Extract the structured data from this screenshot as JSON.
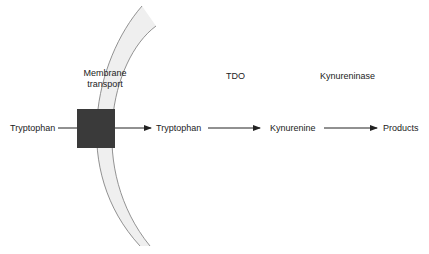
{
  "diagram": {
    "type": "metabolic-pathway",
    "membrane": {
      "label_line1": "Membrane",
      "label_line2": "transport",
      "band_fill": "#efefef",
      "band_stroke": "#777777",
      "transporter_fill": "#3a3a3a"
    },
    "nodes": [
      {
        "id": "tryptophan-outside",
        "label": "Tryptophan"
      },
      {
        "id": "tryptophan-inside",
        "label": "Tryptophan"
      },
      {
        "id": "kynurenine",
        "label": "Kynurenine"
      },
      {
        "id": "products",
        "label": "Products"
      }
    ],
    "enzymes": [
      {
        "id": "tdo",
        "label": "TDO"
      },
      {
        "id": "kynureninase",
        "label": "Kynureninase"
      }
    ],
    "edges": [
      {
        "from": "tryptophan-outside",
        "to": "tryptophan-inside",
        "via": "Membrane transport"
      },
      {
        "from": "tryptophan-inside",
        "to": "kynurenine",
        "via": "TDO"
      },
      {
        "from": "kynurenine",
        "to": "products",
        "via": "Kynureninase"
      }
    ],
    "line_color": "#222222"
  }
}
